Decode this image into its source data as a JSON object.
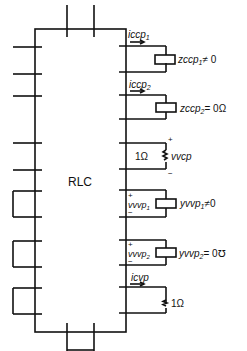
{
  "diagram": {
    "block_label": "RLC",
    "ports": [
      {
        "id": "ccp1",
        "current_label": "iccp",
        "current_sub": "1",
        "element": "impedance",
        "element_label": "zccp",
        "element_sub": "1",
        "element_value": "≠ 0"
      },
      {
        "id": "ccp2",
        "current_label": "iccp",
        "current_sub": "2",
        "element": "impedance",
        "element_label": "zccp",
        "element_sub": "2",
        "element_value": "= 0Ω"
      },
      {
        "id": "vcp",
        "resistor_label": "1Ω",
        "voltage_label": "vvcp",
        "plus": "+",
        "minus": "−"
      },
      {
        "id": "vvp1",
        "voltage_label": "vvvp",
        "voltage_sub": "1",
        "element": "admittance",
        "element_label": "yvvp",
        "element_sub": "1",
        "element_value": "≠0",
        "plus": "+",
        "minus": "−"
      },
      {
        "id": "vvp2",
        "voltage_label": "vvvp",
        "voltage_sub": "2",
        "element": "admittance",
        "element_label": "yvvp",
        "element_sub": "2",
        "element_value": "= 0℧",
        "plus": "+",
        "minus": "−"
      },
      {
        "id": "cvp",
        "current_label": "icvp",
        "resistor_label": "1Ω"
      }
    ]
  }
}
